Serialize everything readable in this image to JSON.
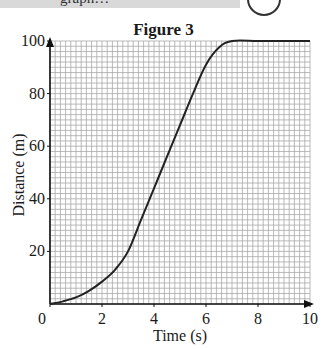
{
  "header": {
    "clipped_text": "graph…",
    "badge_icon": "circle-logo-icon"
  },
  "chart_data": {
    "type": "line",
    "title": "Figure 3",
    "xlabel": "Time (s)",
    "ylabel": "Distance (m)",
    "xlim": [
      0,
      10
    ],
    "ylim": [
      0,
      100
    ],
    "x_ticks": [
      0,
      2,
      4,
      6,
      8,
      10
    ],
    "y_ticks": [
      20,
      40,
      60,
      80,
      100
    ],
    "x_tick_labels": [
      "0",
      "2",
      "4",
      "6",
      "8",
      "10"
    ],
    "y_tick_labels": [
      "20",
      "40",
      "60",
      "80",
      "100"
    ],
    "grid": true,
    "grid_minor_step": {
      "x": 0.2,
      "y": 2
    },
    "legend": null,
    "series": [
      {
        "name": "distance-time",
        "x": [
          0,
          0.5,
          1,
          1.5,
          2,
          2.5,
          3,
          3.5,
          4,
          4.5,
          5,
          5.5,
          6,
          6.5,
          7,
          8,
          9,
          10
        ],
        "values": [
          0,
          1,
          2.5,
          5,
          8.5,
          13,
          20,
          32,
          44,
          56,
          68,
          80,
          91,
          97.5,
          100,
          100,
          100,
          100
        ]
      }
    ],
    "colors": {
      "line": "#222222",
      "grid": "#a8a8a8",
      "axis": "#111111"
    }
  }
}
